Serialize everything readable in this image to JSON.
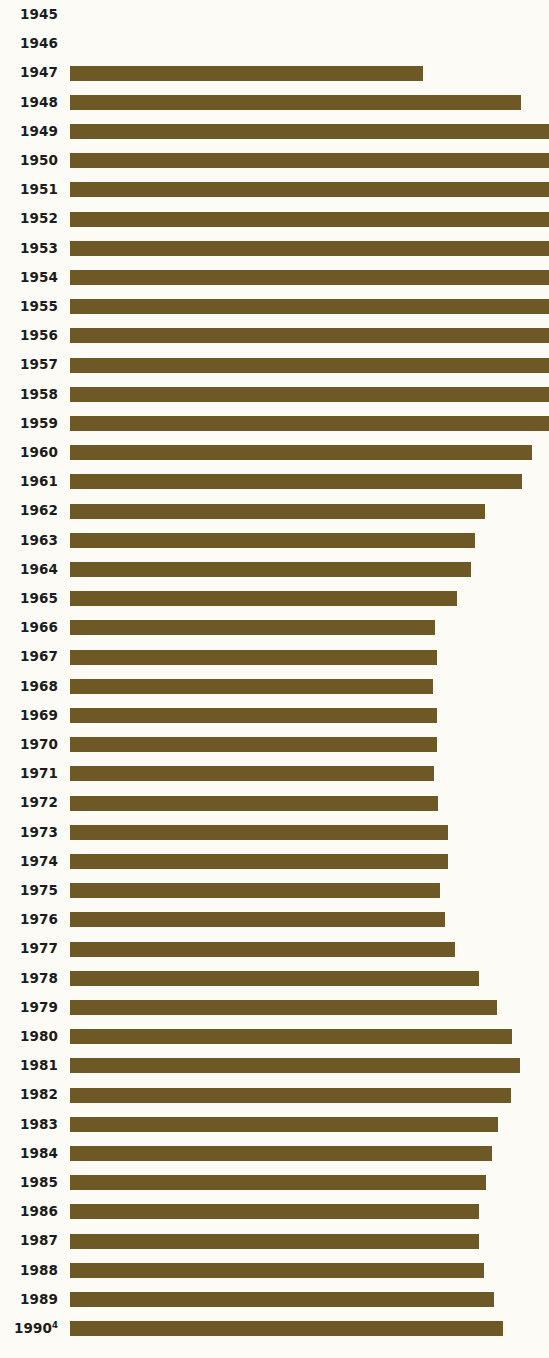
{
  "chart_data": {
    "type": "bar",
    "orientation": "horizontal",
    "title": "",
    "subtitle": "",
    "xlabel": "",
    "ylabel": "",
    "grid": false,
    "legend": null,
    "axis_visible": false,
    "bar_color": "#6e5826",
    "background_color": "#fdfbf5",
    "categories": [
      "1945",
      "1946",
      "1947",
      "1948",
      "1949",
      "1950",
      "1951",
      "1952",
      "1953",
      "1954",
      "1955",
      "1956",
      "1957",
      "1958",
      "1959",
      "1960",
      "1961",
      "1962",
      "1963",
      "1964",
      "1965",
      "1966",
      "1967",
      "1968",
      "1969",
      "1970",
      "1971",
      "1972",
      "1973",
      "1974",
      "1975",
      "1976",
      "1977",
      "1978",
      "1979",
      "1980",
      "1981",
      "1982",
      "1983",
      "1984",
      "1985",
      "1986",
      "1987",
      "1988",
      "1989",
      "1990"
    ],
    "category_notes": {
      "1990": "4"
    },
    "values": [
      0,
      0,
      74.3,
      95.1,
      100,
      100,
      100,
      100,
      100,
      100,
      100,
      100,
      100,
      100,
      100,
      97.3,
      95.2,
      87.4,
      85.3,
      84.6,
      81.5,
      76.9,
      77.3,
      76.4,
      77.3,
      77.3,
      76.6,
      77.5,
      79.6,
      79.6,
      77.9,
      78.9,
      80.9,
      85.9,
      89.7,
      93.0,
      94.7,
      92.9,
      90.1,
      88.8,
      87.5,
      86.0,
      86.0,
      87.0,
      89.2,
      92.0
    ],
    "bar_pixel_ends": [
      70,
      70,
      423,
      521,
      549,
      549,
      549,
      549,
      549,
      549,
      549,
      549,
      549,
      549,
      549,
      532,
      522,
      485,
      475,
      471,
      457,
      435,
      437,
      433,
      437,
      437,
      434,
      438,
      448,
      448,
      440,
      445,
      455,
      479,
      497,
      512,
      520,
      511,
      498,
      492,
      486,
      479,
      479,
      484,
      494,
      503
    ],
    "xlim": [
      0,
      100
    ],
    "value_unit": "percent"
  },
  "chart_meta": {
    "label_font_size_px": 13.5,
    "bar_height_px": 15,
    "row_pitch_px": 29.2,
    "bar_left_px": 70
  }
}
